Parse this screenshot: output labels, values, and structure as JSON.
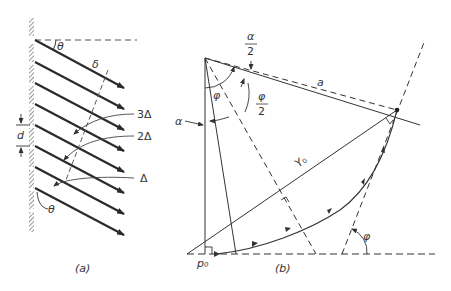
{
  "figure": {
    "panel_a": {
      "caption": "(a)",
      "labels": {
        "theta_top": "θ",
        "delta": "δ",
        "three_delta": "3Δ",
        "two_delta": "2Δ",
        "one_delta": "Δ",
        "d": "d",
        "theta_bottom": "θ"
      }
    },
    "panel_b": {
      "caption": "(b)",
      "labels": {
        "alpha_half_num": "α",
        "alpha_half_den": "2",
        "a": "a",
        "phi": "φ",
        "phi_half_num": "φ",
        "phi_half_den": "2",
        "alpha": "α",
        "y0": "Y₀",
        "p0": "p₀",
        "phi_right": "φ"
      }
    },
    "colors": {
      "ink": "#333333",
      "ray": "#2a2a2a",
      "hatch": "#555555"
    }
  }
}
